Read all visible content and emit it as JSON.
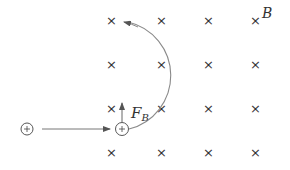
{
  "diagram": {
    "field": {
      "label": "B",
      "direction": "into-page",
      "symbol": "×",
      "columns_x": [
        111,
        161,
        208,
        255
      ],
      "rows_y": [
        20,
        64,
        108,
        152
      ]
    },
    "charges": [
      {
        "id": "initial",
        "symbol": "+",
        "x": 27,
        "y": 129
      },
      {
        "id": "at-entry",
        "symbol": "+",
        "x": 121,
        "y": 129
      }
    ],
    "force": {
      "label_main": "F",
      "label_sub": "B",
      "direction": "up"
    },
    "velocity_arrow": {
      "from_x": 43,
      "to_x": 110,
      "y": 129
    },
    "trajectory": {
      "shape": "semicircle",
      "rotation": "counterclockwise",
      "center_x": 121,
      "center_y": 76,
      "radius": 53
    },
    "colors": {
      "ink": "#333333",
      "path": "#888888"
    }
  }
}
